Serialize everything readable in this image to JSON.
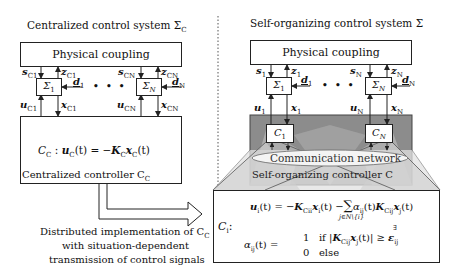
{
  "left": {
    "title": "Centralized control system Σ",
    "title_sub": "C",
    "coupling_label": "Physical coupling",
    "subsystem_1": {
      "name": "Σ",
      "sub": "1",
      "s": "s",
      "s_sub": "C1",
      "z": "z",
      "z_sub": "C1",
      "u": "u",
      "u_sub": "C1",
      "x": "x",
      "x_sub": "C1",
      "d": "d",
      "d_sub": "1"
    },
    "subsystem_N": {
      "name": "Σ",
      "sub": "N",
      "s": "s",
      "s_sub": "CN",
      "z": "z",
      "z_sub": "CN",
      "u": "u",
      "u_sub": "CN",
      "x": "x",
      "x_sub": "CN",
      "d": "d",
      "d_sub": "N"
    },
    "ellipsis": "• • •",
    "controller_law": "C_C : u_C(t) = −K_C x_C(t)",
    "controller_law_parts": {
      "lhs": "C",
      "lhs_sub": "C",
      "colon": " : ",
      "u": "u",
      "u_sub": "C",
      "mid": "(t) = −",
      "K": "K",
      "K_sub": "C",
      "x": "x",
      "x_sub": "C",
      "end": "(t)"
    },
    "controller_name": "Centralized controller C",
    "controller_name_sub": "C"
  },
  "arrow_caption": {
    "line1": "Distributed implementation of C",
    "line1_sub": "C",
    "line2": "with situation-dependent",
    "line3": "transmission of control signals"
  },
  "right": {
    "title": "Self-organizing control system Σ",
    "coupling_label": "Physical coupling",
    "subsystem_1": {
      "name": "Σ",
      "sub": "1",
      "s": "s",
      "s_sub": "1",
      "z": "z",
      "z_sub": "1",
      "u": "u",
      "u_sub": "1",
      "x": "x",
      "x_sub": "1",
      "d": "d",
      "d_sub": "1"
    },
    "subsystem_N": {
      "name": "Σ",
      "sub": "N",
      "s": "s",
      "s_sub": "N",
      "z": "z",
      "z_sub": "N",
      "u": "u",
      "u_sub": "N",
      "x": "x",
      "x_sub": "N",
      "d": "d",
      "d_sub": "N"
    },
    "ellipsis": "• • •",
    "local_controller_1": {
      "name": "C",
      "sub": "1"
    },
    "local_controller_N": {
      "name": "C",
      "sub": "N"
    },
    "network_label": "Communication network",
    "controller_name": "Self-organizing controller C"
  },
  "formula": {
    "lhs": "C",
    "lhs_sub": "i",
    "colon": ":",
    "line1": "u_i(t) = −K_Cii x_i(t) − Σ_{j∈N\\{i}} α_ij(t) K_Cij x_j(t)",
    "line1_parts": {
      "u": "u",
      "u_sub": "i",
      "a": "(t) = −",
      "K": "K",
      "K_sub": "Cii",
      "x": "x",
      "x_sub": "i",
      "b": "(t) −",
      "sum": "∑",
      "sum_sub": "j∈N\\{i}",
      "alpha": "α",
      "alpha_sub": "ij",
      "c": "(t)",
      "K2": "K",
      "K2_sub": "Cij",
      "x2": "x",
      "x2_sub": "j",
      "d": "(t)"
    },
    "line2": "α_ij(t) = { 1 if |K_Cij x_j(t)| ≥∃ ε_ij ; 0 else }",
    "line2_parts": {
      "alpha": "α",
      "alpha_sub": "ij",
      "a": "(t) =",
      "case1_val": "1",
      "case1_cond": "if |",
      "K": "K",
      "K_sub": "Cij",
      "x": "x",
      "x_sub": "j",
      "b": "(t)| ",
      "geq": "≥",
      "exists": "∃",
      "eps": "ε",
      "eps_sub": "ij",
      "case2_val": "0",
      "case2_cond": "else"
    }
  },
  "colors": {
    "line": "#222222",
    "controller_gray": "#8c8c8c",
    "controller_light": "#c8c8c8",
    "overlay_light": "#dedede",
    "divider": "#555555"
  }
}
